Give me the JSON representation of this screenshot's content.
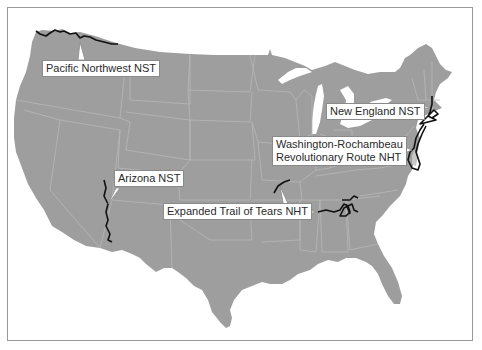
{
  "map": {
    "title": "",
    "region": "Contiguous United States",
    "land_color": "#9e9e9e",
    "border_color": "#b8b8b8",
    "trail_color": "#111111",
    "background_color": "#ffffff"
  },
  "labels": [
    {
      "id": "pacific-northwest",
      "lines": [
        "Pacific Northwest NST"
      ]
    },
    {
      "id": "new-england",
      "lines": [
        "New England NST"
      ]
    },
    {
      "id": "washington-rochambeau",
      "lines": [
        "Washington-Rochambeau",
        "Revolutionary Route NHT"
      ]
    },
    {
      "id": "arizona",
      "lines": [
        "Arizona NST"
      ]
    },
    {
      "id": "trail-of-tears",
      "lines": [
        "Expanded Trail of Tears NHT"
      ]
    }
  ]
}
